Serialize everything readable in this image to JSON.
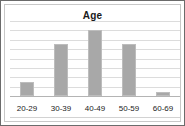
{
  "chart_data": {
    "type": "bar",
    "title": "Age",
    "xlabel": "",
    "ylabel": "",
    "categories": [
      "20-29",
      "30-39",
      "40-49",
      "50-59",
      "60-69"
    ],
    "values": [
      1.5,
      5.5,
      7.0,
      5.5,
      0.4
    ],
    "ylim": [
      0,
      8
    ],
    "gridlines": [
      0,
      1,
      2,
      3,
      4,
      5,
      6,
      7,
      8
    ],
    "grid": true,
    "legend": "none",
    "tick_labels_y": [],
    "series": [
      {
        "name": "Age",
        "values": [
          1.5,
          5.5,
          7.0,
          5.5,
          0.4
        ]
      }
    ],
    "colors": {
      "bar_fill": "#a8a8a8",
      "bar_border": "#bdbdbd",
      "gridline": "#dcdcdc",
      "baseline": "#b4b4b4",
      "frame_border": "#6b6b6b",
      "plot_border": "#c8c8c8",
      "title_color": "#1a1a1a",
      "label_color": "#232323",
      "background": "#ffffff"
    }
  }
}
